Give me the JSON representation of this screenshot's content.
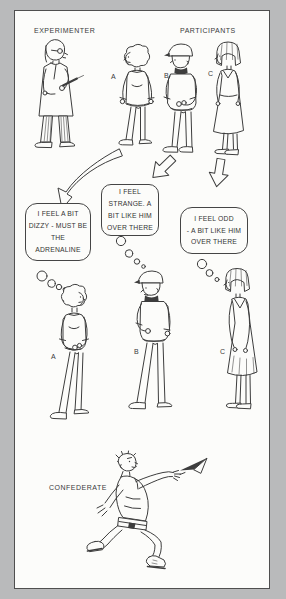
{
  "illustration": {
    "background_color": "#b9babb",
    "panel_color": "#fcfcfa",
    "ink_color": "#3d3d3d",
    "labels": {
      "experimenter": "EXPERIMENTER",
      "participants": "PARTICIPANTS",
      "confederate": "CONFEDERATE"
    },
    "participant_letters": [
      "A",
      "B",
      "C"
    ],
    "thought_bubbles": [
      {
        "speaker_letter": "A",
        "text": "I FEEL A BIT\nDIZZY - MUST BE\nTHE\nADRENALINE"
      },
      {
        "speaker_letter": "B",
        "text": "I FEEL\nSTRANGE. A\nBIT LIKE HIM\nOVER THERE"
      },
      {
        "speaker_letter": "C",
        "text": "I FEEL ODD\n- A BIT LIKE HIM\nOVER THERE"
      }
    ]
  }
}
